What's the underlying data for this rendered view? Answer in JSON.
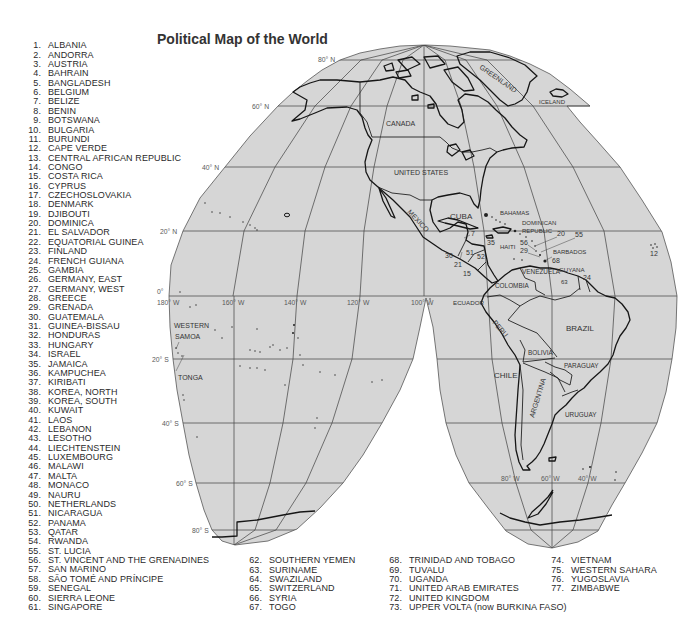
{
  "title": "Political Map of the World",
  "colors": {
    "map_fill": "#d6d6d6",
    "coastline": "#161616",
    "graticule": "#4a4a4a",
    "text": "#2a2a2a",
    "background": "#ffffff"
  },
  "map": {
    "graticule_labels": {
      "lat_80n": "80° N",
      "lat_60n": "60° N",
      "lat_40n": "40° N",
      "lat_20n": "20° N",
      "lat_0": "0°",
      "lat_20s": "20° S",
      "lat_40s": "40° S",
      "lat_60s": "60° S",
      "lat_80s": "80° S",
      "lon_180w": "180° W",
      "lon_160w": "160° W",
      "lon_140w": "140° W",
      "lon_120w": "120° W",
      "lon_100w": "100° W",
      "lon_80w": "80° W",
      "lon_60w": "60° W",
      "lon_40w": "40° W"
    },
    "region_labels": {
      "greenland": "GREENLAND",
      "iceland": "ICELAND",
      "canada": "CANADA",
      "united_states": "UNITED STATES",
      "mexico": "MEXICO",
      "cuba": "CUBA",
      "bahamas": "BAHAMAS",
      "dominican_1": "DOMINICAN",
      "dominican_2": "REPUBLIC",
      "haiti": "HAITI",
      "barbados": "BARBADOS",
      "venezuela": "VENEZUELA",
      "guyana": "GUYANA",
      "colombia": "COLOMBIA",
      "ecuador": "ECUADOR",
      "peru": "PERU",
      "brazil": "BRAZIL",
      "bolivia": "BOLIVIA",
      "paraguay": "PARAGUAY",
      "chile": "CHILE",
      "argentina": "ARGENTINA",
      "uruguay": "URUGUAY",
      "western_samoa_1": "WESTERN",
      "western_samoa_2": "SAMOA",
      "tonga": "TONGA"
    },
    "number_labels": {
      "n7": "7",
      "n35": "35",
      "n56": "56",
      "n20": "20",
      "n55": "55",
      "n29": "29",
      "n68": "68",
      "n30": "30",
      "n21": "21",
      "n51": "51",
      "n52": "52",
      "n15": "15",
      "n24": "24",
      "n63": "63",
      "n12": "12"
    }
  },
  "legend": {
    "col1": [
      {
        "num": "1.",
        "name": "ALBANIA"
      },
      {
        "num": "2.",
        "name": "ANDORRA"
      },
      {
        "num": "3.",
        "name": "AUSTRIA"
      },
      {
        "num": "4.",
        "name": "BAHRAIN"
      },
      {
        "num": "5.",
        "name": "BANGLADESH"
      },
      {
        "num": "6.",
        "name": "BELGIUM"
      },
      {
        "num": "7.",
        "name": "BELIZE"
      },
      {
        "num": "8.",
        "name": "BENIN"
      },
      {
        "num": "9.",
        "name": "BOTSWANA"
      },
      {
        "num": "10.",
        "name": "BULGARIA"
      },
      {
        "num": "11.",
        "name": "BURUNDI"
      },
      {
        "num": "12.",
        "name": "CAPE VERDE"
      },
      {
        "num": "13.",
        "name": "CENTRAL AFRICAN REPUBLIC"
      },
      {
        "num": "14.",
        "name": "CONGO"
      },
      {
        "num": "15.",
        "name": "COSTA RICA"
      },
      {
        "num": "16.",
        "name": "CYPRUS"
      },
      {
        "num": "17.",
        "name": "CZECHOSLOVAKIA"
      },
      {
        "num": "18.",
        "name": "DENMARK"
      },
      {
        "num": "19.",
        "name": "DJIBOUTI"
      },
      {
        "num": "20.",
        "name": "DOMINICA"
      },
      {
        "num": "21.",
        "name": "EL SALVADOR"
      },
      {
        "num": "22.",
        "name": "EQUATORIAL GUINEA"
      },
      {
        "num": "23.",
        "name": "FINLAND"
      },
      {
        "num": "24.",
        "name": "FRENCH GUIANA"
      },
      {
        "num": "25.",
        "name": "GAMBIA"
      },
      {
        "num": "26.",
        "name": "GERMANY, EAST"
      },
      {
        "num": "27.",
        "name": "GERMANY, WEST"
      },
      {
        "num": "28.",
        "name": "GREECE"
      },
      {
        "num": "29.",
        "name": "GRENADA"
      },
      {
        "num": "30.",
        "name": "GUATEMALA"
      },
      {
        "num": "31.",
        "name": "GUINEA-BISSAU"
      },
      {
        "num": "32.",
        "name": "HONDURAS"
      },
      {
        "num": "33.",
        "name": "HUNGARY"
      },
      {
        "num": "34.",
        "name": "ISRAEL"
      },
      {
        "num": "35.",
        "name": "JAMAICA"
      },
      {
        "num": "36.",
        "name": "KAMPUCHEA"
      },
      {
        "num": "37.",
        "name": "KIRIBATI"
      },
      {
        "num": "38.",
        "name": "KOREA, NORTH"
      },
      {
        "num": "39.",
        "name": "KOREA, SOUTH"
      },
      {
        "num": "40.",
        "name": "KUWAIT"
      },
      {
        "num": "41.",
        "name": "LAOS"
      },
      {
        "num": "42.",
        "name": "LEBANON"
      },
      {
        "num": "43.",
        "name": "LESOTHO"
      },
      {
        "num": "44.",
        "name": "LIECHTENSTEIN"
      },
      {
        "num": "45.",
        "name": "LUXEMBOURG"
      },
      {
        "num": "46.",
        "name": "MALAWI"
      },
      {
        "num": "47.",
        "name": "MALTA"
      },
      {
        "num": "48.",
        "name": "MONACO"
      },
      {
        "num": "49.",
        "name": "NAURU"
      },
      {
        "num": "50.",
        "name": "NETHERLANDS"
      },
      {
        "num": "51.",
        "name": "NICARAGUA"
      },
      {
        "num": "52.",
        "name": "PANAMA"
      },
      {
        "num": "53.",
        "name": "QATAR"
      },
      {
        "num": "54.",
        "name": "RWANDA"
      },
      {
        "num": "55.",
        "name": "ST. LUCIA"
      },
      {
        "num": "56.",
        "name": "ST. VINCENT AND THE GRENADINES"
      },
      {
        "num": "57.",
        "name": "SAN MARINO"
      },
      {
        "num": "58.",
        "name": "SÃO TOMÉ AND PRÍNCIPE"
      },
      {
        "num": "59.",
        "name": "SENEGAL"
      },
      {
        "num": "60.",
        "name": "SIERRA LEONE"
      },
      {
        "num": "61.",
        "name": "SINGAPORE"
      }
    ],
    "col2": [
      {
        "num": "62.",
        "name": "SOUTHERN YEMEN"
      },
      {
        "num": "63.",
        "name": "SURINAME"
      },
      {
        "num": "64.",
        "name": "SWAZILAND"
      },
      {
        "num": "65.",
        "name": "SWITZERLAND"
      },
      {
        "num": "66.",
        "name": "SYRIA"
      },
      {
        "num": "67.",
        "name": "TOGO"
      }
    ],
    "col3": [
      {
        "num": "68.",
        "name": "TRINIDAD AND TOBAGO"
      },
      {
        "num": "69.",
        "name": "TUVALU"
      },
      {
        "num": "70.",
        "name": "UGANDA"
      },
      {
        "num": "71.",
        "name": "UNITED ARAB EMIRATES"
      },
      {
        "num": "72.",
        "name": "UNITED KINGDOM"
      },
      {
        "num": "73.",
        "name": "UPPER VOLTA (now BURKINA FASO)"
      }
    ],
    "col4": [
      {
        "num": "74.",
        "name": "VIETNAM"
      },
      {
        "num": "75.",
        "name": "WESTERN SAHARA"
      },
      {
        "num": "76.",
        "name": "YUGOSLAVIA"
      },
      {
        "num": "77.",
        "name": "ZIMBABWE"
      }
    ]
  }
}
